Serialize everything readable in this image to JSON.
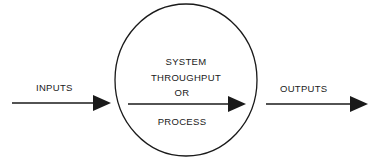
{
  "diagram": {
    "type": "system-flow",
    "input_label": "INPUTS",
    "output_label": "OUTPUTS",
    "process": {
      "line1": "SYSTEM",
      "line2": "THROUGHPUT",
      "line3": "OR",
      "line4": "PROCESS"
    },
    "colors": {
      "stroke": "#1a1a1a",
      "background": "#ffffff"
    }
  }
}
